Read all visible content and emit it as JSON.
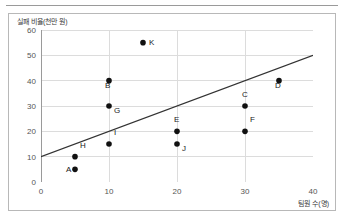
{
  "figure": {
    "ylabel": "실패 비율(천만 원)",
    "xlabel": "팀원 수(명)"
  },
  "chart_data": {
    "type": "scatter",
    "title": "",
    "xlabel": "팀원 수(명)",
    "ylabel": "실패 비율(천만 원)",
    "xlim": [
      0,
      40
    ],
    "ylim": [
      0,
      60
    ],
    "xticks": [
      "0",
      "10",
      "20",
      "30",
      "40"
    ],
    "yticks": [
      "0",
      "10",
      "20",
      "30",
      "40",
      "50",
      "60"
    ],
    "xtick_values": [
      0,
      10,
      20,
      30,
      40
    ],
    "ytick_values": [
      0,
      10,
      20,
      30,
      40,
      50,
      60
    ],
    "grid": true,
    "legend": "none",
    "points": [
      {
        "label": "A",
        "x": 5,
        "y": 5,
        "label_pos": "left"
      },
      {
        "label": "B",
        "x": 10,
        "y": 40,
        "label_pos": "below-left"
      },
      {
        "label": "C",
        "x": 30,
        "y": 30,
        "label_pos": "above-left"
      },
      {
        "label": "D",
        "x": 35,
        "y": 40,
        "label_pos": "below-left"
      },
      {
        "label": "E",
        "x": 20,
        "y": 20,
        "label_pos": "above-left"
      },
      {
        "label": "F",
        "x": 30,
        "y": 20,
        "label_pos": "above-right"
      },
      {
        "label": "G",
        "x": 10,
        "y": 30,
        "label_pos": "below-right"
      },
      {
        "label": "H",
        "x": 5,
        "y": 10,
        "label_pos": "above-right"
      },
      {
        "label": "I",
        "x": 10,
        "y": 15,
        "label_pos": "above-right"
      },
      {
        "label": "J",
        "x": 20,
        "y": 15,
        "label_pos": "below-right"
      },
      {
        "label": "K",
        "x": 15,
        "y": 55,
        "label_pos": "right"
      }
    ],
    "trend_line": {
      "x0": 0,
      "y0": 10,
      "x1": 40,
      "y1": 50,
      "color": "#333333"
    },
    "marker_color": "#111111",
    "grid_color": "#dcdcdc",
    "axis_color": "#9a9a9a"
  }
}
